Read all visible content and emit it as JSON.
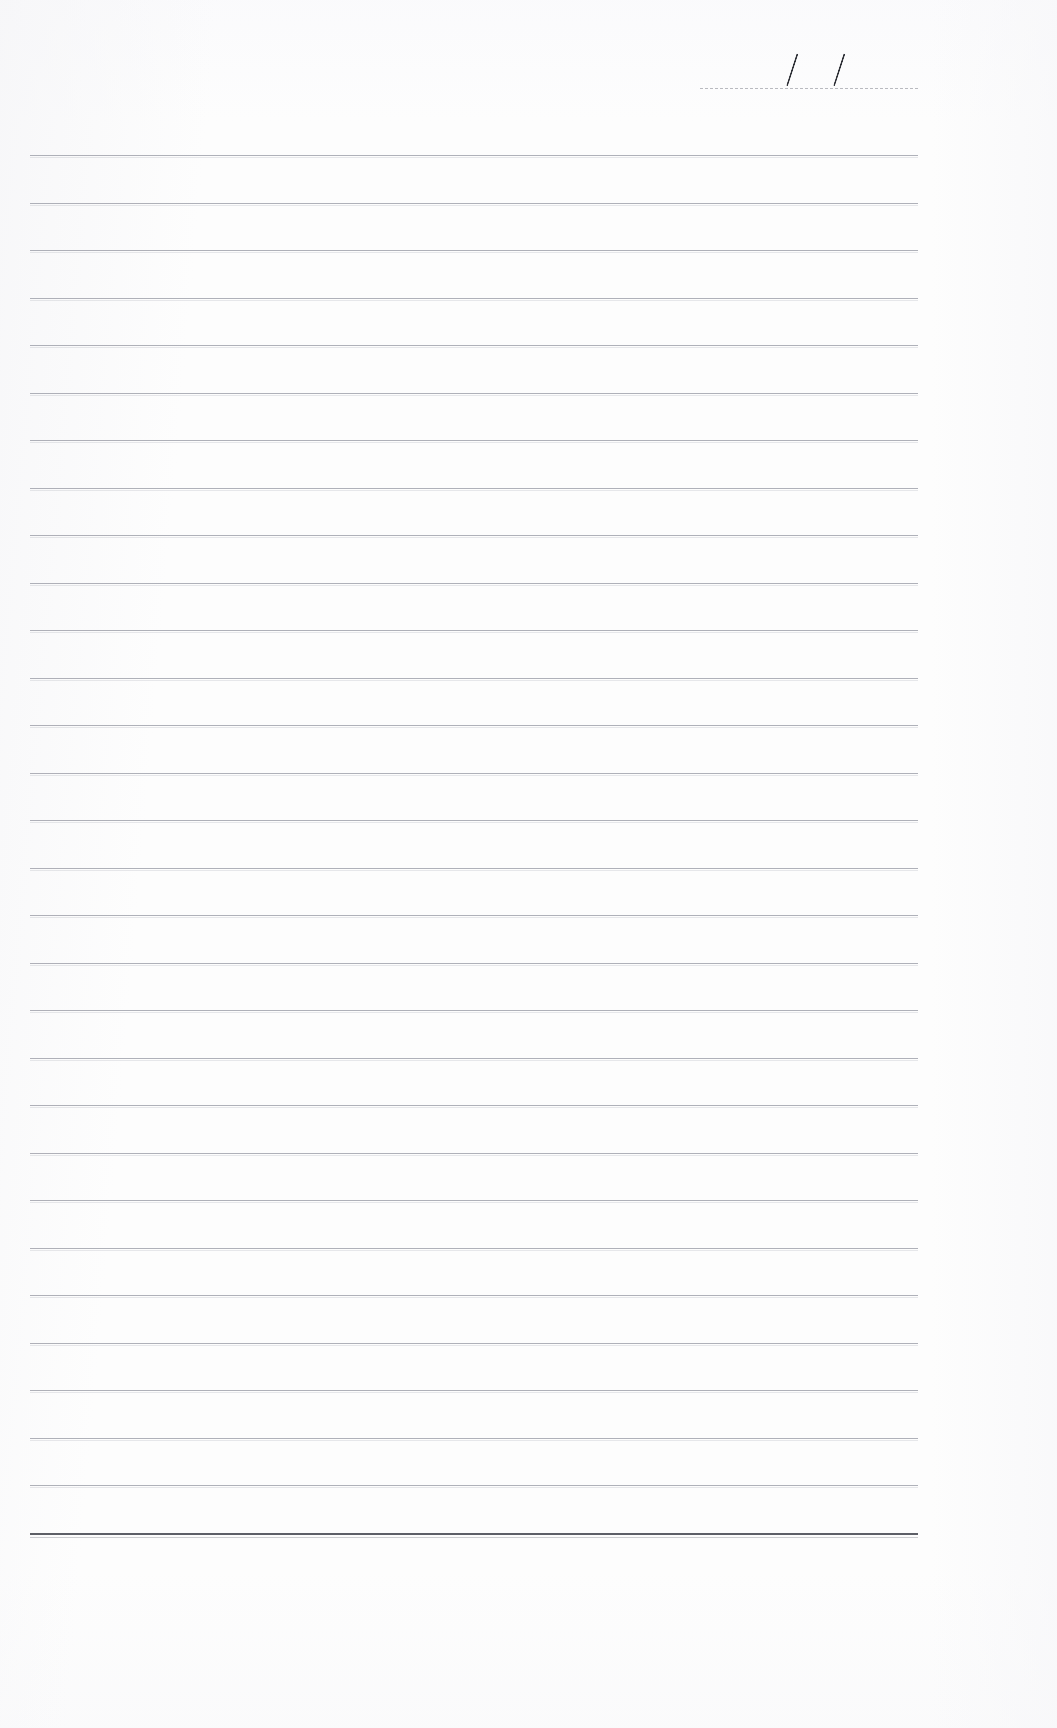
{
  "document": {
    "kind": "lined-notebook-page",
    "title": "Blank ruled notebook page",
    "background_color": "#fdfdfd",
    "width": 1057,
    "height": 1728
  },
  "date_field": {
    "label": "",
    "value": "",
    "separators": [
      "/",
      "/"
    ],
    "rule_color": "#b9babf",
    "ink_color": "#2e3036",
    "rule": {
      "x": 700,
      "y": 88,
      "width": 218
    },
    "slashes": [
      {
        "x": 786,
        "y": 52,
        "height": 34
      },
      {
        "x": 833,
        "y": 52,
        "height": 34
      }
    ]
  },
  "ruled_area": {
    "line_color": "#9a9ca6",
    "heavy_line_color": "#55575f",
    "left": 30,
    "right": 918,
    "first_line_y": 155,
    "spacing": 47.5,
    "line_count": 30,
    "lines_y": [
      155,
      202.5,
      250,
      297.5,
      345,
      392.5,
      440,
      487.5,
      535,
      582.5,
      630,
      677.5,
      725,
      772.5,
      820,
      867.5,
      915,
      962.5,
      1010,
      1057.5,
      1105,
      1152.5,
      1200,
      1247.5,
      1295,
      1342.5,
      1390,
      1437.5,
      1485,
      1533
    ],
    "heavy_line_index": 29
  },
  "content": {
    "text_lines": [],
    "note": ""
  }
}
